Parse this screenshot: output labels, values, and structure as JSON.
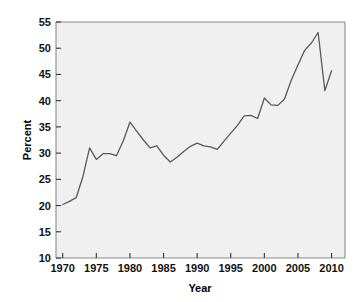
{
  "chart_data": {
    "type": "line",
    "title": "",
    "subtitle": "",
    "xlabel": "Year",
    "ylabel": "Percent",
    "xlim": [
      1969,
      2012
    ],
    "ylim": [
      10,
      55
    ],
    "xticks": [
      1970,
      1975,
      1980,
      1985,
      1990,
      1995,
      2000,
      2005,
      2010
    ],
    "yticks": [
      10,
      15,
      20,
      25,
      30,
      35,
      40,
      45,
      50,
      55
    ],
    "xtick_labels": [
      "1970",
      "1975",
      "1980",
      "1985",
      "1990",
      "1995",
      "2000",
      "2005",
      "2010"
    ],
    "ytick_labels": [
      "10",
      "15",
      "20",
      "25",
      "30",
      "35",
      "40",
      "45",
      "50",
      "55"
    ],
    "grid": false,
    "legend": null,
    "annotations": [],
    "line_color": "#595959",
    "plot_background": "#f0f0f0",
    "frame_color": "#8c8c8c",
    "series": [
      {
        "name": "Percent",
        "x": [
          1970,
          1971,
          1972,
          1973,
          1974,
          1975,
          1976,
          1977,
          1978,
          1979,
          1980,
          1981,
          1982,
          1983,
          1984,
          1985,
          1986,
          1987,
          1988,
          1989,
          1990,
          1991,
          1992,
          1993,
          1994,
          1995,
          1996,
          1997,
          1998,
          1999,
          2000,
          2001,
          2002,
          2003,
          2004,
          2005,
          2006,
          2007,
          2008,
          2009,
          2010
        ],
        "values": [
          20.2,
          20.8,
          21.5,
          25.5,
          31.0,
          28.8,
          29.9,
          29.9,
          29.5,
          32.3,
          35.9,
          34.2,
          32.5,
          31.0,
          31.4,
          29.6,
          28.3,
          29.2,
          30.3,
          31.3,
          31.9,
          31.4,
          31.2,
          30.7,
          32.3,
          33.8,
          35.3,
          37.1,
          37.2,
          36.6,
          40.5,
          39.2,
          39.1,
          40.3,
          43.9,
          46.8,
          49.6,
          51.0,
          53.0,
          41.9,
          45.7
        ]
      }
    ]
  },
  "axis": {
    "ylabel_text": "Percent",
    "xlabel_text": "Year"
  }
}
